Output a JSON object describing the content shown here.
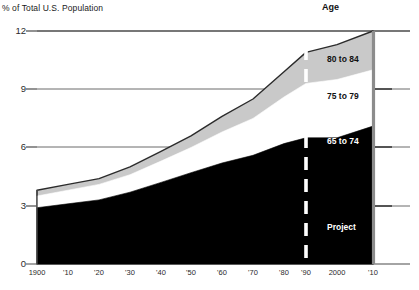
{
  "chart_data": {
    "type": "area",
    "title": "% of Total U.S. Population",
    "subtitle": "",
    "xlabel": "",
    "ylabel": "% of Total U.S. Population",
    "ylim": [
      0,
      12
    ],
    "yticks": [
      0,
      3,
      6,
      9,
      12
    ],
    "ytick_labels": [
      "0",
      "3",
      "6",
      "9",
      "12"
    ],
    "grid": true,
    "legend_position": "inline-band-labels",
    "legend_title": "Age",
    "x": [
      1900,
      1910,
      1920,
      1930,
      1940,
      1950,
      1960,
      1970,
      1980,
      1990,
      2000,
      2010
    ],
    "xtick_labels": [
      "1900",
      "'10",
      "'20",
      "'30",
      "'40",
      "'50",
      "'60",
      "'70",
      "'80",
      "'90",
      "2000",
      "'10"
    ],
    "stacked": true,
    "series": [
      {
        "name": "65 to 74",
        "color": "#000000",
        "values": [
          2.9,
          3.1,
          3.3,
          3.7,
          4.2,
          4.7,
          5.2,
          5.6,
          6.2,
          6.5,
          6.5,
          7.1
        ]
      },
      {
        "name": "75 to 79",
        "color": "#ffffff",
        "values": [
          0.6,
          0.7,
          0.8,
          0.9,
          1.1,
          1.3,
          1.6,
          1.9,
          2.4,
          2.8,
          3.0,
          2.9
        ]
      },
      {
        "name": "80 to 84",
        "color": "#c9c9c9",
        "values": [
          0.3,
          0.3,
          0.3,
          0.4,
          0.5,
          0.6,
          0.8,
          1.0,
          1.3,
          1.6,
          1.8,
          2.0
        ]
      }
    ],
    "totals": [
      3.8,
      4.1,
      4.4,
      5.0,
      5.8,
      6.6,
      7.6,
      8.5,
      9.9,
      10.9,
      11.3,
      12.0
    ],
    "annotations": [
      {
        "name": "projection-divider",
        "label": "Project",
        "x": 1990,
        "style": "dashed-white-vertical"
      }
    ]
  },
  "labels": {
    "band_80_84": "80 to 84",
    "band_75_79": "75 to 79",
    "band_65_74": "65 to 74",
    "projection": "Project"
  }
}
